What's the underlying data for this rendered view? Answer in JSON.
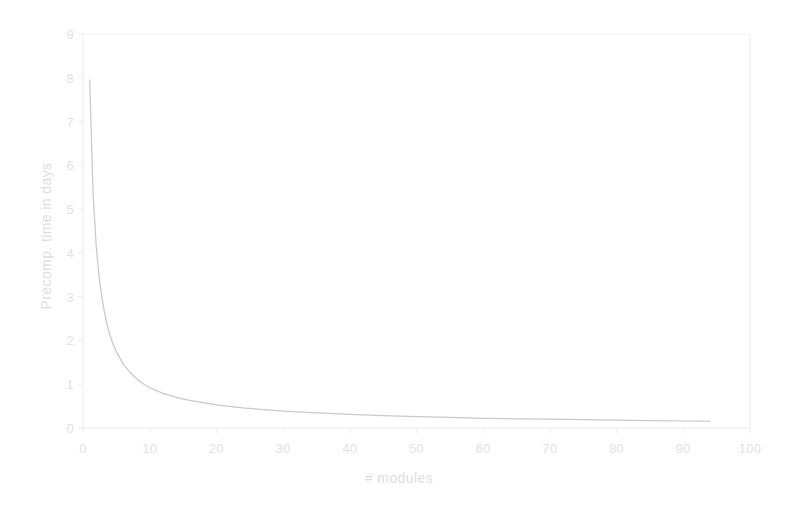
{
  "chart_data": {
    "type": "line",
    "title": "",
    "xlabel": "# modules",
    "ylabel": "Precomp. time in days",
    "xlim": [
      0,
      100
    ],
    "ylim": [
      0,
      9
    ],
    "xticks": [
      0,
      10,
      20,
      30,
      40,
      50,
      60,
      70,
      80,
      90,
      100
    ],
    "yticks": [
      0,
      1,
      2,
      3,
      4,
      5,
      6,
      7,
      8,
      9
    ],
    "grid": false,
    "legend": "none",
    "series": [
      {
        "name": "Precomp. time",
        "color": "#c9c9cc",
        "x": [
          1,
          1.5,
          2,
          2.5,
          3,
          3.5,
          4,
          4.5,
          5,
          6,
          7,
          8,
          9,
          10,
          12,
          14,
          16,
          18,
          20,
          24,
          28,
          32,
          36,
          40,
          45,
          50,
          55,
          60,
          65,
          70,
          75,
          80,
          85,
          90,
          94
        ],
        "values": [
          7.95,
          5.4,
          4.1,
          3.35,
          2.82,
          2.43,
          2.14,
          1.92,
          1.74,
          1.47,
          1.28,
          1.13,
          1.01,
          0.92,
          0.79,
          0.7,
          0.63,
          0.58,
          0.53,
          0.46,
          0.41,
          0.37,
          0.34,
          0.31,
          0.28,
          0.26,
          0.24,
          0.22,
          0.21,
          0.2,
          0.19,
          0.18,
          0.17,
          0.16,
          0.155
        ]
      }
    ],
    "axis_color": "#e8e8ea",
    "text_color": "#e2e2e4"
  },
  "axes": {
    "x_tick_labels": [
      "0",
      "10",
      "20",
      "30",
      "40",
      "50",
      "60",
      "70",
      "80",
      "90",
      "100"
    ],
    "y_tick_labels": [
      "0",
      "1",
      "2",
      "3",
      "4",
      "5",
      "6",
      "7",
      "8",
      "9"
    ],
    "x_title": "# modules",
    "y_title": "Precomp. time in days"
  }
}
